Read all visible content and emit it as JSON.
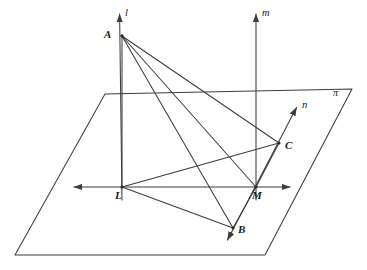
{
  "figure": {
    "stroke_color": "#3d3d3d",
    "label_color": "#1a1a1a",
    "background_color": "#ffffff",
    "width": 367,
    "height": 270
  },
  "labels": {
    "point_a": "A",
    "point_b": "B",
    "point_c": "C",
    "point_l": "L",
    "point_m": "M",
    "line_l": "l",
    "line_m": "m",
    "line_n": "n",
    "plane_pi": "π"
  },
  "label_positions": {
    "point_a": {
      "x": 104,
      "y": 29
    },
    "point_b": {
      "x": 238,
      "y": 224
    },
    "point_c": {
      "x": 285,
      "y": 140
    },
    "point_l": {
      "x": 115,
      "y": 190
    },
    "point_m": {
      "x": 252,
      "y": 190
    },
    "line_l": {
      "x": 125,
      "y": 8
    },
    "line_m": {
      "x": 262,
      "y": 8
    },
    "line_n": {
      "x": 302,
      "y": 100
    },
    "plane_pi": {
      "x": 333,
      "y": 88
    }
  },
  "geometry": {
    "points": {
      "A": {
        "x": 122,
        "y": 36
      },
      "B": {
        "x": 233,
        "y": 228
      },
      "C": {
        "x": 279,
        "y": 143
      },
      "L": {
        "x": 122,
        "y": 187
      },
      "M": {
        "x": 256,
        "y": 187
      }
    },
    "plane_pi_corners": [
      {
        "x": 105,
        "y": 94
      },
      {
        "x": 352,
        "y": 89
      },
      {
        "x": 265,
        "y": 255
      },
      {
        "x": 15,
        "y": 255
      }
    ],
    "line_l": {
      "from": {
        "x": 122,
        "y": 200
      },
      "to": {
        "x": 119,
        "y": 12
      },
      "arrow_at": "to"
    },
    "line_m": {
      "from": {
        "x": 256,
        "y": 200
      },
      "to": {
        "x": 256,
        "y": 12
      },
      "arrow_at": "to"
    },
    "line_n": {
      "from": {
        "x": 226,
        "y": 243
      },
      "to": {
        "x": 298,
        "y": 105
      },
      "arrow_at": "both"
    },
    "line_LM": {
      "from": {
        "x": 72,
        "y": 187
      },
      "to": {
        "x": 292,
        "y": 187
      },
      "arrow_at": "both"
    },
    "segments": [
      {
        "name": "A-L",
        "from": "A",
        "to": "L"
      },
      {
        "name": "A-B",
        "from": "A",
        "to": "B"
      },
      {
        "name": "A-M",
        "from": "A",
        "to": "M"
      },
      {
        "name": "A-C",
        "from": "A",
        "to": "C"
      },
      {
        "name": "L-B",
        "from": "L",
        "to": "B"
      },
      {
        "name": "L-C",
        "from": "L",
        "to": "C"
      },
      {
        "name": "M-B",
        "from": "M",
        "to": "B"
      },
      {
        "name": "M-C",
        "from": "M",
        "to": "C"
      }
    ]
  }
}
